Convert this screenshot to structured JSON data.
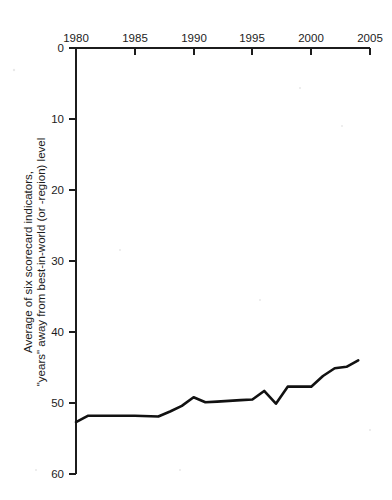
{
  "chart_data": {
    "type": "line",
    "title": "",
    "xlabel": "",
    "ylabel_line1": "Average of six scorecard indicators,",
    "ylabel_line2": "\"years\" away from best-in-world (or -region) level",
    "xlim": [
      1980,
      2005
    ],
    "ylim": [
      0,
      60
    ],
    "y_axis_inverted": true,
    "grid": false,
    "legend": null,
    "x_ticks": [
      1980,
      1985,
      1990,
      1995,
      2000,
      2005
    ],
    "x_tick_labels": [
      "1980",
      "1985",
      "1990",
      "1995",
      "2000",
      "2005"
    ],
    "y_ticks": [
      0,
      10,
      20,
      30,
      40,
      50,
      60
    ],
    "y_tick_labels": [
      "0",
      "10",
      "20",
      "30",
      "40",
      "50",
      "60"
    ],
    "x_axis_position": "top",
    "y_axis_position": "left",
    "series": [
      {
        "name": "Average of six scorecard indicators",
        "color": "#111111",
        "x": [
          1980,
          1981,
          1983,
          1985,
          1987,
          1988,
          1989,
          1990,
          1991,
          1992,
          1993,
          1994,
          1995,
          1996,
          1997,
          1998,
          1999,
          2000,
          2001,
          2002,
          2003,
          2004
        ],
        "values": [
          52.7,
          51.8,
          51.8,
          51.8,
          51.9,
          51.2,
          50.4,
          49.2,
          49.9,
          49.8,
          49.7,
          49.6,
          49.5,
          48.3,
          50.1,
          47.7,
          47.7,
          47.7,
          46.2,
          45.1,
          44.9,
          44.0
        ]
      }
    ]
  },
  "colors": {
    "background": "#ffffff",
    "axis": "#1c1c1c",
    "line": "#111111",
    "text": "#1c1c1c"
  }
}
